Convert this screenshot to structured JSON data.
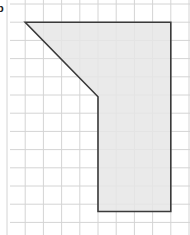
{
  "figure": {
    "label": "b",
    "grid": {
      "cols": 10,
      "rows": 13,
      "cell_px": 18.2,
      "origin_x": 7,
      "origin_y": 4,
      "line_color": "#d4d4d4"
    },
    "shape": {
      "name": "composite-polygon",
      "fill": "#e6e6e6",
      "stroke": "#3a3a3a",
      "vertices_grid": [
        [
          1,
          1
        ],
        [
          9,
          1
        ],
        [
          9,
          11.4
        ],
        [
          5,
          11.4
        ],
        [
          5,
          5.1
        ]
      ]
    }
  }
}
